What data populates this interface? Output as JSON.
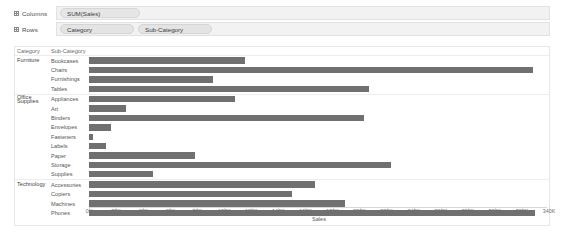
{
  "shelves": {
    "columns": {
      "label": "Columns",
      "icon": "grid-icon",
      "pills": [
        "SUM(Sales)"
      ]
    },
    "rows": {
      "label": "Rows",
      "icon": "grid-icon",
      "pills": [
        "Category",
        "Sub-Category"
      ]
    }
  },
  "headers": {
    "category": "Category",
    "subcategory": "Sub-Category"
  },
  "chart_data": {
    "type": "bar",
    "orientation": "horizontal",
    "title": "",
    "xlabel": "Sales",
    "ylabel": "",
    "xlim": [
      0,
      340000
    ],
    "grid": false,
    "legend": false,
    "bar_color": "#707070",
    "tick_labels": [
      "0K",
      "20K",
      "40K",
      "60K",
      "80K",
      "100K",
      "120K",
      "140K",
      "160K",
      "180K",
      "200K",
      "220K",
      "240K",
      "260K",
      "280K",
      "300K",
      "320K",
      "340K"
    ],
    "tick_values": [
      0,
      20000,
      40000,
      60000,
      80000,
      100000,
      120000,
      140000,
      160000,
      180000,
      200000,
      220000,
      240000,
      260000,
      280000,
      300000,
      320000,
      340000
    ],
    "groups": [
      {
        "category": "Furniture",
        "items": [
          {
            "subcategory": "Bookcases",
            "value": 115000
          },
          {
            "subcategory": "Chairs",
            "value": 328000
          },
          {
            "subcategory": "Furnishings",
            "value": 92000
          },
          {
            "subcategory": "Tables",
            "value": 207000
          }
        ]
      },
      {
        "category": "Office Supplies",
        "items": [
          {
            "subcategory": "Appliances",
            "value": 108000
          },
          {
            "subcategory": "Art",
            "value": 27000
          },
          {
            "subcategory": "Binders",
            "value": 203000
          },
          {
            "subcategory": "Envelopes",
            "value": 16000
          },
          {
            "subcategory": "Fasteners",
            "value": 3000
          },
          {
            "subcategory": "Labels",
            "value": 12500
          },
          {
            "subcategory": "Paper",
            "value": 78000
          },
          {
            "subcategory": "Storage",
            "value": 223000
          },
          {
            "subcategory": "Supplies",
            "value": 47000
          }
        ]
      },
      {
        "category": "Technology",
        "items": [
          {
            "subcategory": "Accessories",
            "value": 167000
          },
          {
            "subcategory": "Copiers",
            "value": 150000
          },
          {
            "subcategory": "Machines",
            "value": 189000
          },
          {
            "subcategory": "Phones",
            "value": 330000
          }
        ]
      }
    ]
  }
}
